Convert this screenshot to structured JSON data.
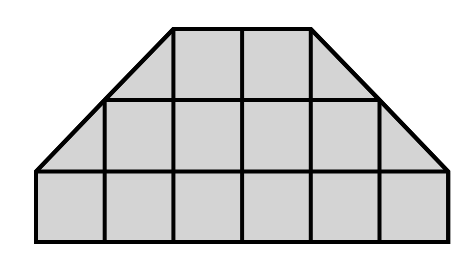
{
  "figure": {
    "shape_name": "isosceles-trapezoid",
    "canvas": {
      "width": 474,
      "height": 254
    },
    "colors": {
      "fill": "#d4d4d4",
      "stroke": "#000000",
      "background": "#ffffff"
    },
    "stroke_width": 4,
    "grid": {
      "cell_size": 68.7,
      "columns": 6,
      "rows": 3,
      "x_lines": [
        36,
        104.7,
        173.4,
        242.1,
        310.8,
        379.5,
        448.2
      ],
      "y_lines": [
        29,
        100,
        171.5,
        242
      ],
      "rows_detail": [
        {
          "name": "top-row",
          "y_top": 29,
          "y_bottom": 100,
          "x_left": 173.4,
          "x_right": 310.8,
          "cells": 2
        },
        {
          "name": "middle-row",
          "y_top": 100,
          "y_bottom": 171.5,
          "x_left": 104.7,
          "x_right": 379.5,
          "cells": 4
        },
        {
          "name": "bottom-row",
          "y_top": 171.5,
          "y_bottom": 242,
          "x_left": 36,
          "x_right": 448.2,
          "cells": 6
        }
      ]
    },
    "outline_points": "36,242 36,171.5 104.7,100 173.4,29 310.8,29 379.5,100 448.2,171.5 448.2,242",
    "outline_vertices": [
      {
        "name": "bottom-left",
        "x": 36,
        "y": 242
      },
      {
        "name": "left-base-corner",
        "x": 36,
        "y": 171.5
      },
      {
        "name": "left-diagonal-mid",
        "x": 104.7,
        "y": 100
      },
      {
        "name": "top-left",
        "x": 173.4,
        "y": 29
      },
      {
        "name": "top-right",
        "x": 310.8,
        "y": 29
      },
      {
        "name": "right-diagonal-mid",
        "x": 379.5,
        "y": 100
      },
      {
        "name": "right-base-corner",
        "x": 448.2,
        "y": 171.5
      },
      {
        "name": "bottom-right",
        "x": 448.2,
        "y": 242
      }
    ],
    "internal_segments": [
      {
        "name": "horizontal-upper",
        "x1": 104.7,
        "y1": 100,
        "x2": 379.5,
        "y2": 100
      },
      {
        "name": "horizontal-lower",
        "x1": 36,
        "y1": 171.5,
        "x2": 448.2,
        "y2": 171.5
      },
      {
        "name": "vertical-1",
        "x1": 104.7,
        "y1": 100,
        "x2": 104.7,
        "y2": 242
      },
      {
        "name": "vertical-2",
        "x1": 173.4,
        "y1": 29,
        "x2": 173.4,
        "y2": 242
      },
      {
        "name": "vertical-3",
        "x1": 242.1,
        "y1": 29,
        "x2": 242.1,
        "y2": 242
      },
      {
        "name": "vertical-4",
        "x1": 310.8,
        "y1": 29,
        "x2": 310.8,
        "y2": 242
      },
      {
        "name": "vertical-5",
        "x1": 379.5,
        "y1": 100,
        "x2": 379.5,
        "y2": 242
      }
    ]
  }
}
